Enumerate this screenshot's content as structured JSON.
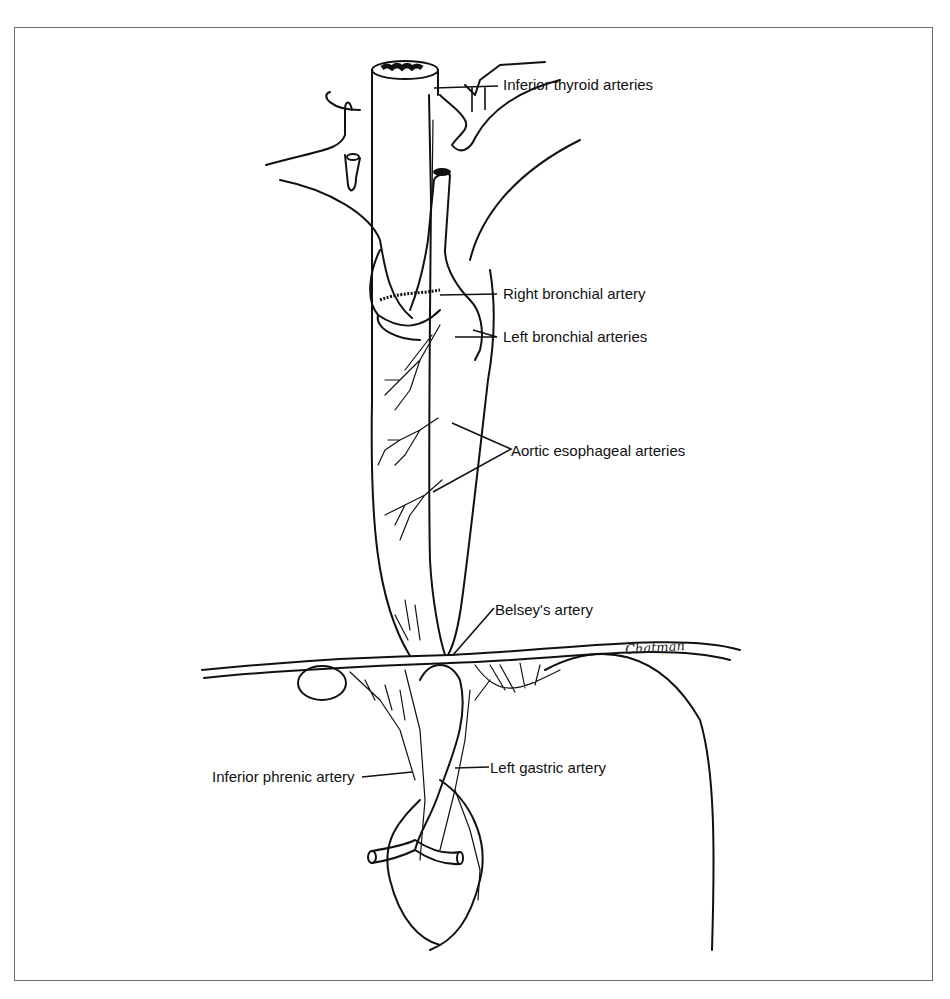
{
  "figure": {
    "type": "anatomical line illustration",
    "signature": "Chatman",
    "labels": [
      {
        "id": "inferior-thyroid",
        "text": "Inferior thyroid arteries"
      },
      {
        "id": "right-bronchial",
        "text": "Right bronchial artery"
      },
      {
        "id": "left-bronchial",
        "text": "Left bronchial arteries"
      },
      {
        "id": "aortic-esophageal",
        "text": "Aortic esophageal arteries"
      },
      {
        "id": "belsey",
        "text": "Belsey's artery"
      },
      {
        "id": "inferior-phrenic",
        "text": "Inferior phrenic artery"
      },
      {
        "id": "left-gastric",
        "text": "Left gastric artery"
      }
    ]
  }
}
